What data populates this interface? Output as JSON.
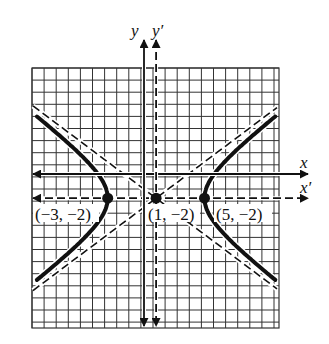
{
  "figure": {
    "type": "hyperbola-translation-diagram",
    "equation_hint": "(x' )^2/16 - (y')^2/9 = 1, center (1,-2)",
    "axes": {
      "x_label": "x",
      "y_label": "y",
      "x_prime_label": "x′",
      "y_prime_label": "y′"
    },
    "points": [
      {
        "id": "left-vertex",
        "label": "(−3, −2)",
        "x": -3,
        "y": -2
      },
      {
        "id": "center",
        "label": "(1, −2)",
        "x": 1,
        "y": -2
      },
      {
        "id": "right-vertex",
        "label": "(5, −2)",
        "x": 5,
        "y": -2
      }
    ],
    "hyperbola": {
      "h": 1,
      "k": -2,
      "a": 4,
      "b": 3,
      "orientation": "horizontal"
    },
    "colors": {
      "ink": "#111111",
      "grid": "#333333",
      "background": "#ffffff"
    }
  },
  "chart_data": {
    "type": "line",
    "title": "",
    "xlabel": "x",
    "ylabel": "y",
    "grid": true,
    "series": [
      {
        "name": "hyperbola",
        "description": "(x-1)^2/16 - (y+2)^2/9 = 1"
      },
      {
        "name": "asymptote-1",
        "description": "y + 2 = (3/4)(x - 1)",
        "style": "dashed"
      },
      {
        "name": "asymptote-2",
        "description": "y + 2 = -(3/4)(x - 1)",
        "style": "dashed"
      }
    ],
    "annotations": [
      "(−3, −2)",
      "(1, −2)",
      "(5, −2)"
    ],
    "xlim": [
      -10,
      10.5
    ],
    "ylim": [
      -12.5,
      9
    ]
  }
}
